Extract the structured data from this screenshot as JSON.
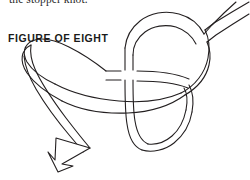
{
  "page": {
    "background_color": "#ffffff",
    "width": 250,
    "height": 180
  },
  "body_text": {
    "clipped_line": "the stopper knot."
  },
  "caption": {
    "label": "FIGURE OF EIGHT"
  },
  "figure": {
    "name": "figure-of-eight-knot",
    "line_color": "#231f20",
    "fill_color": "#ffffff",
    "stroke_width": 1.1,
    "arrow_direction": "down-left",
    "standing_ends": 2,
    "standing_end_direction": "upper-right"
  }
}
